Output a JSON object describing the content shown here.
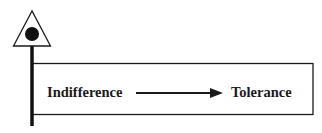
{
  "diagram": {
    "type": "process-flow",
    "marker": {
      "shape": "triangle-with-dot-on-pole"
    },
    "box": {
      "from_label": "Indifference",
      "to_label": "Tolerance",
      "arrow": "right"
    },
    "colors": {
      "ink": "#1a1a1a",
      "background": "#ffffff"
    }
  }
}
